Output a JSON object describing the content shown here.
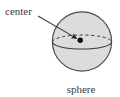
{
  "figure": {
    "caption": "sphere",
    "annotation_label": "center",
    "background_color": "#ffffff",
    "width": 120,
    "height": 97
  },
  "sphere": {
    "name": "sphere",
    "fill_color": "#dcdcdc",
    "stroke_color": "#4a4a4a",
    "center_x": 82,
    "center_y": 41.5,
    "radius": 30
  },
  "equator": {
    "name": "equator-ellipse",
    "center_x": 82,
    "center_y": 42,
    "radius_x": 30,
    "radius_y": 7,
    "back_arc_style": "dashed",
    "front_arc_style": "solid",
    "stroke_color": "#3a3a3a"
  },
  "center_point": {
    "name": "center-point",
    "x": 80,
    "y": 40,
    "radius": 2.6,
    "color": "#000000"
  },
  "leader": {
    "name": "leader-arrow",
    "from_x": 38,
    "from_y": 16,
    "to_x": 77,
    "to_y": 38.6,
    "color": "#3a3a3a",
    "has_arrowhead": true
  },
  "labels": {
    "center": {
      "text": "center",
      "x": 5,
      "y": 15,
      "anchor": "start"
    },
    "sphere": {
      "text": "sphere",
      "x": 81,
      "y": 93,
      "anchor": "middle"
    }
  }
}
